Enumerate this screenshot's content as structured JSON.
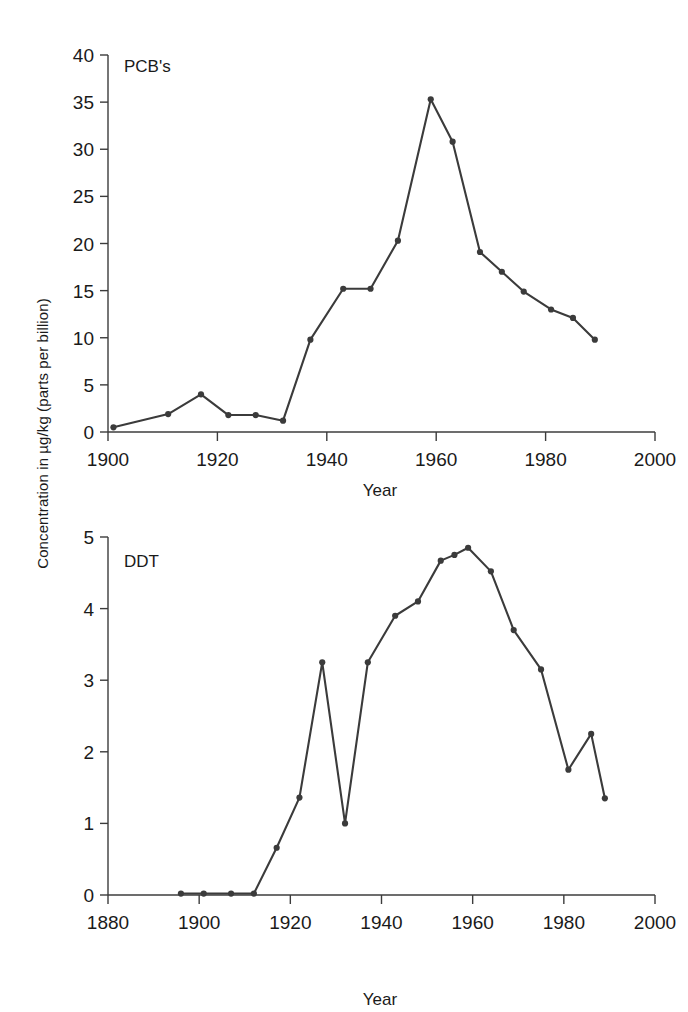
{
  "figure": {
    "shared_ylabel": "Concentration in µg/kg (parts per billion)",
    "background_color": "#ffffff",
    "line_color": "#3b3b3b",
    "axis_color": "#3c3c3c"
  },
  "chart_data": [
    {
      "type": "line",
      "title": "PCB's",
      "xlabel": "Year",
      "ylabel": "Concentration in µg/kg (parts per billion)",
      "xlim": [
        1900,
        2000
      ],
      "ylim": [
        0,
        40
      ],
      "xticks": [
        1900,
        1920,
        1940,
        1960,
        1980,
        2000
      ],
      "xtick_labels": [
        "1900",
        "1920",
        "1940",
        "1960",
        "1980",
        "2000"
      ],
      "yticks": [
        0,
        5,
        10,
        15,
        20,
        25,
        30,
        35,
        40
      ],
      "ytick_labels": [
        "0",
        "5",
        "10",
        "15",
        "20",
        "25",
        "30",
        "35",
        "40"
      ],
      "grid": false,
      "legend": false,
      "markers": "filled-circle",
      "series": [
        {
          "name": "PCB's",
          "x": [
            1901,
            1911,
            1917,
            1922,
            1927,
            1932,
            1937,
            1943,
            1948,
            1953,
            1959,
            1963,
            1968,
            1972,
            1976,
            1981,
            1985,
            1989
          ],
          "values": [
            0.5,
            1.9,
            4.0,
            1.8,
            1.8,
            1.2,
            9.8,
            15.2,
            15.2,
            20.3,
            35.3,
            30.8,
            19.1,
            17.0,
            14.9,
            13.0,
            12.1,
            9.8
          ]
        }
      ]
    },
    {
      "type": "line",
      "title": "DDT",
      "xlabel": "Year",
      "ylabel": "Concentration in µg/kg (parts per billion)",
      "xlim": [
        1880,
        2000
      ],
      "ylim": [
        0,
        5
      ],
      "xticks": [
        1880,
        1900,
        1920,
        1940,
        1960,
        1980,
        2000
      ],
      "xtick_labels": [
        "1880",
        "1900",
        "1920",
        "1940",
        "1960",
        "1980",
        "2000"
      ],
      "yticks": [
        0,
        1,
        2,
        3,
        4,
        5
      ],
      "ytick_labels": [
        "0",
        "1",
        "2",
        "3",
        "4",
        "5"
      ],
      "grid": false,
      "legend": false,
      "markers": "filled-circle",
      "series": [
        {
          "name": "DDT",
          "x": [
            1896,
            1901,
            1907,
            1912,
            1917,
            1922,
            1927,
            1932,
            1937,
            1943,
            1948,
            1953,
            1956,
            1959,
            1964,
            1969,
            1975,
            1981,
            1986,
            1989
          ],
          "values": [
            0.02,
            0.02,
            0.02,
            0.02,
            0.66,
            1.36,
            3.25,
            1.0,
            3.25,
            3.9,
            4.1,
            4.67,
            4.75,
            4.85,
            4.52,
            3.7,
            3.15,
            1.75,
            2.25,
            1.35
          ]
        }
      ]
    }
  ]
}
